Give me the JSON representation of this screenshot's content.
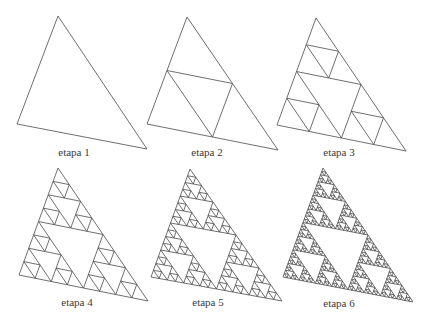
{
  "figure": {
    "line_color": "#4a4a4a",
    "background": "#ffffff",
    "stages": [
      {
        "label": "etapa 1",
        "depth": 0,
        "vertices": [
          [
            58,
            16
          ],
          [
            17,
            124
          ],
          [
            147,
            149
          ]
        ],
        "label_pos": [
          74,
          146
        ]
      },
      {
        "label": "etapa 2",
        "depth": 1,
        "vertices": [
          [
            187,
            17
          ],
          [
            147,
            124
          ],
          [
            278,
            150
          ]
        ],
        "label_pos": [
          207,
          146
        ]
      },
      {
        "label": "etapa 3",
        "depth": 2,
        "vertices": [
          [
            316,
            18
          ],
          [
            277,
            125
          ],
          [
            406,
            151
          ]
        ],
        "label_pos": [
          339,
          146
        ]
      },
      {
        "label": "etapa 4",
        "depth": 3,
        "vertices": [
          [
            58,
            168
          ],
          [
            19,
            275
          ],
          [
            148,
            301
          ]
        ],
        "label_pos": [
          77,
          296
        ]
      },
      {
        "label": "etapa 5",
        "depth": 4,
        "vertices": [
          [
            190,
            169
          ],
          [
            151,
            277
          ],
          [
            282,
            301
          ]
        ],
        "label_pos": [
          208,
          296
        ]
      },
      {
        "label": "etapa 6",
        "depth": 5,
        "vertices": [
          [
            323,
            168
          ],
          [
            283,
            277
          ],
          [
            413,
            302
          ]
        ],
        "label_pos": [
          339,
          297
        ]
      }
    ]
  }
}
